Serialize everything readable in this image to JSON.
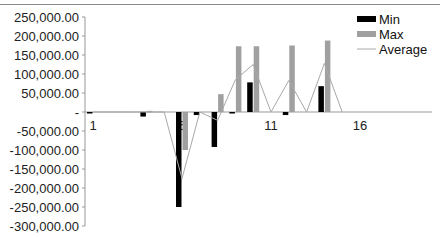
{
  "chart_data": {
    "type": "bar",
    "title": "",
    "xlabel": "",
    "ylabel": "",
    "ylim": [
      -300000,
      250000
    ],
    "grid": false,
    "legend_position": "top-right",
    "y_ticks": [
      "250,000.00",
      "200,000.00",
      "150,000.00",
      "100,000.00",
      "50,000.00",
      "-",
      "-50,000.00",
      "-100,000.00",
      "-150,000.00",
      "-200,000.00",
      "-250,000.00",
      "-300,000.00"
    ],
    "x_tick_labels": [
      "1",
      "6",
      "11",
      "16"
    ],
    "categories": [
      1,
      2,
      3,
      4,
      5,
      6,
      7,
      8,
      9,
      10,
      11,
      12,
      13,
      14,
      15,
      16,
      17,
      18,
      19,
      20
    ],
    "series": [
      {
        "name": "Min",
        "kind": "bar",
        "color": "#000000",
        "values": [
          -1000,
          0,
          0,
          -12000,
          0,
          -250000,
          -8000,
          -92000,
          -4000,
          78000,
          0,
          -8000,
          0,
          68000,
          0,
          0,
          0,
          0,
          0,
          0
        ]
      },
      {
        "name": "Max",
        "kind": "bar",
        "color": "#a0a0a0",
        "values": [
          0,
          0,
          0,
          3000,
          0,
          -100000,
          0,
          47000,
          173000,
          173000,
          0,
          175000,
          0,
          188000,
          0,
          0,
          0,
          0,
          0,
          0
        ]
      },
      {
        "name": "Average",
        "kind": "line",
        "color": "#a8a8a8",
        "values": [
          0,
          0,
          0,
          0,
          0,
          -175000,
          0,
          -22000,
          85000,
          125000,
          0,
          83000,
          0,
          128000,
          0,
          0,
          0,
          0,
          0,
          0
        ]
      }
    ]
  },
  "legend": [
    {
      "label": "Min",
      "swatch": "bar",
      "color": "#000000"
    },
    {
      "label": "Max",
      "swatch": "bar",
      "color": "#a0a0a0"
    },
    {
      "label": "Average",
      "swatch": "line",
      "color": "#a8a8a8"
    }
  ]
}
